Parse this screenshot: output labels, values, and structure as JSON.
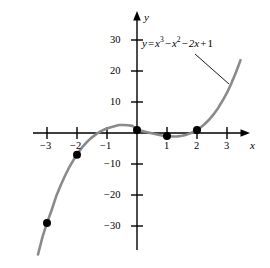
{
  "figure": {
    "kind": "cartesian-graph",
    "background": "#ffffff",
    "curve_color": "#8a8a8a",
    "axis_color": "#000000",
    "point_color": "#000000"
  },
  "equation": {
    "lhs": "y",
    "equals": "=",
    "term1_base": "x",
    "term1_exp": "3",
    "minus1": "−",
    "term2_base": "x",
    "term2_exp": "2",
    "minus2": "−",
    "term3": "2x",
    "plus": "+",
    "term4": "1",
    "plain": "y = x³ − x² − 2x + 1"
  },
  "axes": {
    "x_name": "x",
    "y_name": "y",
    "x_ticks": [
      {
        "value": -3,
        "label": "−3"
      },
      {
        "value": -2,
        "label": "−2"
      },
      {
        "value": -1,
        "label": "−1"
      },
      {
        "value": 1,
        "label": "1"
      },
      {
        "value": 2,
        "label": "2"
      },
      {
        "value": 3,
        "label": "3"
      }
    ],
    "y_ticks": [
      {
        "value": 30,
        "label": "30"
      },
      {
        "value": 20,
        "label": "20"
      },
      {
        "value": 10,
        "label": "10"
      },
      {
        "value": -10,
        "label": "−10"
      },
      {
        "value": -20,
        "label": "−20"
      },
      {
        "value": -30,
        "label": "−30"
      }
    ]
  },
  "chart_data": {
    "type": "line",
    "title": "",
    "subtitle": "",
    "xlabel": "x",
    "ylabel": "y",
    "xlim": [
      -3.3,
      3.7
    ],
    "ylim": [
      -35,
      34
    ],
    "grid": false,
    "legend": null,
    "annotations": [
      {
        "text": "y = x³ − x² − 2x + 1",
        "type": "curve-label",
        "leader_from": [
          1.95,
          25.5
        ],
        "leader_to": [
          3.05,
          16.5
        ]
      }
    ],
    "series": [
      {
        "name": "y = x³ − x² − 2x + 1",
        "type": "line",
        "color": "#8a8a8a",
        "expression": "x^3 - x^2 - 2x + 1",
        "x": [
          -3.3,
          -3.15,
          -3.0,
          -2.85,
          -2.7,
          -2.55,
          -2.4,
          -2.25,
          -2.1,
          -1.95,
          -1.8,
          -1.65,
          -1.5,
          -1.35,
          -1.2,
          -1.05,
          -0.9,
          -0.75,
          -0.6,
          -0.45,
          -0.3,
          -0.15,
          0.0,
          0.15,
          0.3,
          0.45,
          0.6,
          0.75,
          0.9,
          1.05,
          1.2,
          1.35,
          1.5,
          1.65,
          1.8,
          1.95,
          2.1,
          2.25,
          2.4,
          2.55,
          2.7,
          2.85,
          3.0,
          3.15,
          3.3,
          3.45
        ],
        "y": [
          -39.2,
          -33.5,
          -29.0,
          -25.0,
          -20.6,
          -17.0,
          -13.8,
          -10.9,
          -8.4,
          -6.2,
          -4.3,
          -2.7,
          -1.4,
          -0.3,
          0.6,
          1.3,
          1.8,
          2.2,
          2.6,
          2.6,
          2.5,
          2.3,
          1.0,
          0.68,
          0.34,
          0.0,
          -0.35,
          -0.64,
          -0.98,
          -1.05,
          -1.11,
          -1.08,
          -0.88,
          -0.53,
          0.0,
          0.72,
          1.65,
          2.83,
          4.26,
          5.98,
          8.0,
          10.4,
          13.0,
          16.1,
          19.6,
          23.5
        ]
      }
    ],
    "points": [
      {
        "x": -3,
        "y": -29,
        "label": ""
      },
      {
        "x": -2,
        "y": -7,
        "label": ""
      },
      {
        "x": 0,
        "y": 1,
        "label": ""
      },
      {
        "x": 1,
        "y": -1,
        "label": ""
      },
      {
        "x": 2,
        "y": 1,
        "label": ""
      }
    ]
  }
}
